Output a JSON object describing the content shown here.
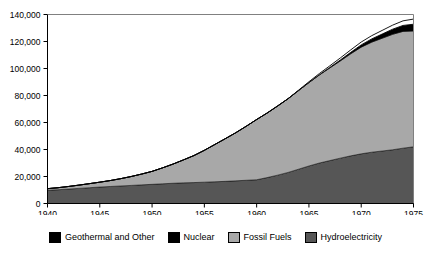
{
  "chart_data": {
    "type": "area",
    "stacked": true,
    "title": "",
    "subtitle": "",
    "xlabel": "",
    "ylabel": "",
    "xlim": [
      1940,
      1975
    ],
    "ylim": [
      0,
      140000
    ],
    "grid": false,
    "legend_position": "bottom",
    "x": [
      1940,
      1941,
      1942,
      1943,
      1944,
      1945,
      1946,
      1947,
      1948,
      1949,
      1950,
      1951,
      1952,
      1953,
      1954,
      1955,
      1956,
      1957,
      1958,
      1959,
      1960,
      1961,
      1962,
      1963,
      1964,
      1965,
      1966,
      1967,
      1968,
      1969,
      1970,
      1971,
      1972,
      1973,
      1974,
      1975
    ],
    "x_tick_labels": [
      "1940",
      "1945",
      "1950",
      "1955",
      "1960",
      "1965",
      "1970",
      "1975"
    ],
    "x_ticks": [
      1940,
      1945,
      1950,
      1955,
      1960,
      1965,
      1970,
      1975
    ],
    "y_ticks": [
      0,
      20000,
      40000,
      60000,
      80000,
      100000,
      120000,
      140000
    ],
    "y_tick_labels": [
      "0",
      "20,000",
      "40,000",
      "60,000",
      "80,000",
      "100,000",
      "120,000",
      "140,000"
    ],
    "series": [
      {
        "name": "Hydroelectricity",
        "color": "#565656",
        "stack_order": 1,
        "values": [
          9800,
          10200,
          10700,
          11200,
          11700,
          12200,
          12600,
          13000,
          13400,
          13800,
          14200,
          14600,
          15000,
          15300,
          15500,
          15800,
          16100,
          16400,
          16800,
          17200,
          17600,
          19200,
          21000,
          23000,
          25400,
          27800,
          30000,
          31800,
          33600,
          35300,
          36800,
          38000,
          38900,
          39800,
          41000,
          42000
        ]
      },
      {
        "name": "Fossil Fuels",
        "color": "#a8a8a8",
        "stack_order": 2,
        "values": [
          1200,
          1500,
          1900,
          2400,
          3000,
          3600,
          4400,
          5400,
          6600,
          8000,
          9600,
          11800,
          14200,
          17000,
          20000,
          23600,
          27600,
          31600,
          35600,
          40000,
          44600,
          47800,
          51200,
          54600,
          58200,
          61800,
          65200,
          68600,
          72000,
          75600,
          79000,
          81500,
          83500,
          85500,
          86500,
          85800
        ]
      },
      {
        "name": "Nuclear",
        "color": "#000000",
        "stack_order": 3,
        "values": [
          0,
          0,
          0,
          0,
          0,
          0,
          0,
          0,
          0,
          0,
          0,
          0,
          0,
          0,
          0,
          0,
          0,
          0,
          0,
          0,
          0,
          0,
          0,
          0,
          0,
          0,
          200,
          400,
          700,
          1100,
          1700,
          2400,
          3100,
          3800,
          4400,
          5000
        ]
      },
      {
        "name": "Geothermal and Other",
        "color": "#ffffff",
        "stack_order": 4,
        "values": [
          0,
          0,
          0,
          0,
          0,
          0,
          0,
          0,
          0,
          0,
          0,
          0,
          0,
          0,
          0,
          0,
          0,
          0,
          0,
          0,
          0,
          0,
          0,
          0,
          300,
          600,
          900,
          1200,
          1500,
          1800,
          2100,
          2400,
          2700,
          3000,
          3400,
          3800
        ]
      }
    ]
  },
  "legend": {
    "items": [
      {
        "label": "Geothermal and Other",
        "color": "#000000"
      },
      {
        "label": "Nuclear",
        "color": "#000000"
      },
      {
        "label": "Fossil Fuels",
        "color": "#a8a8a8"
      },
      {
        "label": "Hydroelectricity",
        "color": "#565656"
      }
    ]
  },
  "axis": {
    "frame_color": "#808080",
    "tick_color": "#000000"
  }
}
